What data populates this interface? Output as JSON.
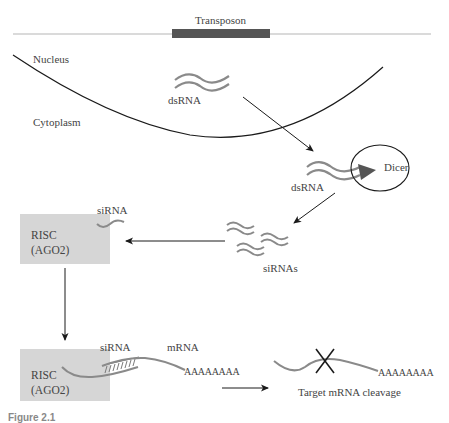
{
  "figure": {
    "caption": "Figure 2.1"
  },
  "labels": {
    "transposon": "Transposon",
    "nucleus": "Nucleus",
    "cytoplasm": "Cytoplasm",
    "dsrna_nucleus": "dsRNA",
    "dsrna_dicer": "dsRNA",
    "dicer": "Dicer",
    "sirnas": "siRNAs",
    "sirna_risc": "siRNA",
    "risc_top_line1": "RISC",
    "risc_top_line2": "(AGO2)",
    "risc_bottom_line1": "RISC",
    "risc_bottom_line2": "(AGO2)",
    "sirna_bottom": "siRNA",
    "mrna": "mRNA",
    "polya_bound": "AAAAAAAA",
    "polya_cleaved": "AAAAAAAA",
    "target_cleavage": "Target mRNA cleavage"
  },
  "colors": {
    "line": "#1a1a1a",
    "rna_strand": "#8a8a8a",
    "transposon_bar": "#555555",
    "chromosome_line": "#b0b0b0",
    "risc_box": "#d6d6d6",
    "dicer_wedge": "#555555"
  }
}
